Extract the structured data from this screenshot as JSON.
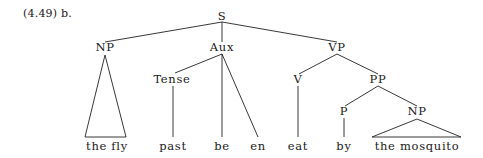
{
  "figure": {
    "example_label": "(4.49) b.",
    "width": 483,
    "height": 158,
    "background_color": "#ffffff",
    "line_color": "#222222",
    "text_color": "#1a1a1a"
  },
  "tree": {
    "type": "syntax-tree",
    "sentence": "the fly past be en eat by the mosquito",
    "nodes": [
      {
        "id": "S",
        "label": "S",
        "x": 222,
        "y": 20,
        "kind": "nonterminal"
      },
      {
        "id": "NP1",
        "label": "NP",
        "x": 105,
        "y": 51,
        "kind": "nonterminal"
      },
      {
        "id": "Aux",
        "label": "Aux",
        "x": 222,
        "y": 51,
        "kind": "nonterminal"
      },
      {
        "id": "VP",
        "label": "VP",
        "x": 337,
        "y": 51,
        "kind": "nonterminal"
      },
      {
        "id": "Tense",
        "label": "Tense",
        "x": 172,
        "y": 83,
        "kind": "nonterminal"
      },
      {
        "id": "V",
        "label": "V",
        "x": 298,
        "y": 83,
        "kind": "nonterminal"
      },
      {
        "id": "PP",
        "label": "PP",
        "x": 378,
        "y": 83,
        "kind": "nonterminal"
      },
      {
        "id": "P",
        "label": "P",
        "x": 344,
        "y": 115,
        "kind": "nonterminal"
      },
      {
        "id": "NP2",
        "label": "NP",
        "x": 417,
        "y": 115,
        "kind": "nonterminal"
      }
    ],
    "leaves": [
      {
        "id": "L1",
        "label": "the fly",
        "x": 107,
        "y": 150
      },
      {
        "id": "L2",
        "label": "past",
        "x": 173,
        "y": 150
      },
      {
        "id": "L3",
        "label": "be",
        "x": 222,
        "y": 150
      },
      {
        "id": "L4",
        "label": "en",
        "x": 258,
        "y": 150
      },
      {
        "id": "L5",
        "label": "eat",
        "x": 298,
        "y": 150
      },
      {
        "id": "L6",
        "label": "by",
        "x": 344,
        "y": 150
      },
      {
        "id": "L7",
        "label": "the mosquito",
        "x": 417,
        "y": 150
      }
    ],
    "branches": [
      {
        "from": "S",
        "to": "NP1",
        "x1": 222,
        "y1": 22,
        "x2": 105,
        "y2": 42
      },
      {
        "from": "S",
        "to": "Aux",
        "x1": 222,
        "y1": 22,
        "x2": 222,
        "y2": 42
      },
      {
        "from": "S",
        "to": "VP",
        "x1": 222,
        "y1": 22,
        "x2": 337,
        "y2": 42
      },
      {
        "from": "Aux",
        "to": "Tense",
        "x1": 222,
        "y1": 54,
        "x2": 175,
        "y2": 73
      },
      {
        "from": "Aux",
        "to": "be",
        "x1": 222,
        "y1": 54,
        "x2": 222,
        "y2": 137
      },
      {
        "from": "Aux",
        "to": "en",
        "x1": 222,
        "y1": 54,
        "x2": 258,
        "y2": 137
      },
      {
        "from": "VP",
        "to": "V",
        "x1": 337,
        "y1": 54,
        "x2": 299,
        "y2": 74
      },
      {
        "from": "VP",
        "to": "PP",
        "x1": 337,
        "y1": 54,
        "x2": 378,
        "y2": 74
      },
      {
        "from": "Tense",
        "to": "past",
        "x1": 173,
        "y1": 86,
        "x2": 173,
        "y2": 137
      },
      {
        "from": "V",
        "to": "eat",
        "x1": 298,
        "y1": 86,
        "x2": 298,
        "y2": 137
      },
      {
        "from": "PP",
        "to": "P",
        "x1": 378,
        "y1": 86,
        "x2": 345,
        "y2": 106
      },
      {
        "from": "PP",
        "to": "NP2",
        "x1": 378,
        "y1": 86,
        "x2": 417,
        "y2": 106
      },
      {
        "from": "P",
        "to": "by",
        "x1": 344,
        "y1": 118,
        "x2": 344,
        "y2": 137
      }
    ],
    "triangles": [
      {
        "parent": "NP1",
        "apex_x": 105,
        "apex_y": 55,
        "left_x": 85,
        "right_x": 126,
        "base_y": 137,
        "covers": "the fly"
      },
      {
        "parent": "NP2",
        "apex_x": 417,
        "apex_y": 119,
        "left_x": 372,
        "right_x": 461,
        "base_y": 137,
        "covers": "the mosquito"
      }
    ]
  }
}
